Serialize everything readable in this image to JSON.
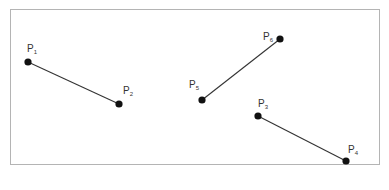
{
  "figure": {
    "caption": "",
    "colors": {
      "line": "#333333",
      "point": "#111111",
      "frame": "#b4b4b4",
      "label": "#333333"
    },
    "points": [
      {
        "id": "P1",
        "base": "P",
        "sub": "1",
        "x": 28,
        "y": 62,
        "lx": 27,
        "ly": 52
      },
      {
        "id": "P2",
        "base": "P",
        "sub": "2",
        "x": 119,
        "y": 104,
        "lx": 123,
        "ly": 94
      },
      {
        "id": "P3",
        "base": "P",
        "sub": "3",
        "x": 258,
        "y": 116,
        "lx": 258,
        "ly": 107
      },
      {
        "id": "P4",
        "base": "P",
        "sub": "4",
        "x": 346,
        "y": 161,
        "lx": 348,
        "ly": 153
      },
      {
        "id": "P5",
        "base": "P",
        "sub": "5",
        "x": 202,
        "y": 100,
        "lx": 189,
        "ly": 88
      },
      {
        "id": "P6",
        "base": "P",
        "sub": "6",
        "x": 280,
        "y": 39,
        "lx": 263,
        "ly": 40
      }
    ],
    "segments": [
      {
        "from": "P1",
        "to": "P2"
      },
      {
        "from": "P5",
        "to": "P6"
      },
      {
        "from": "P3",
        "to": "P4"
      }
    ]
  }
}
